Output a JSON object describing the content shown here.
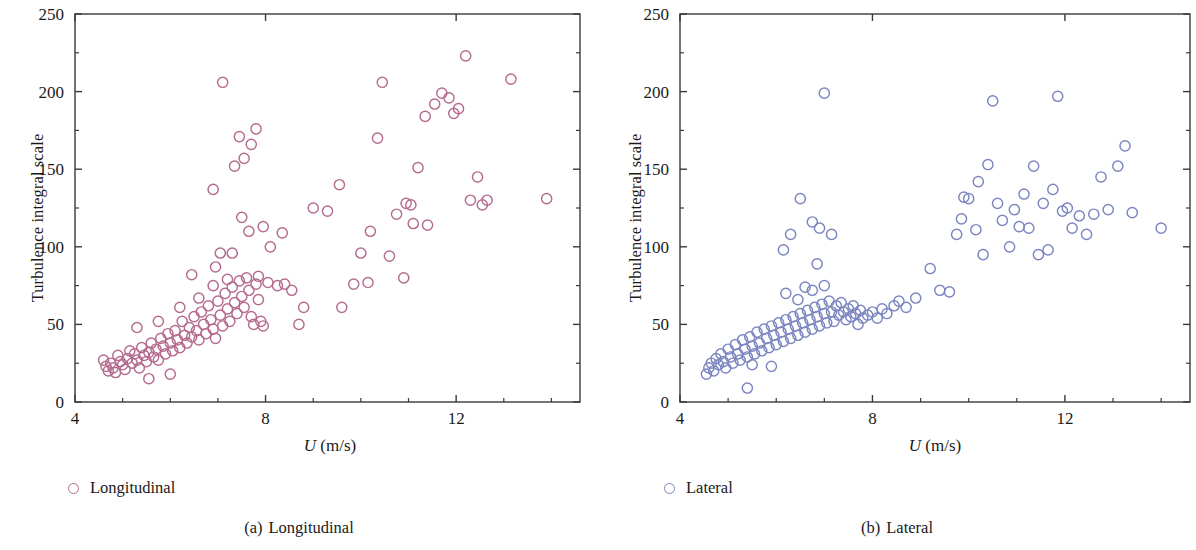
{
  "figure": {
    "panel_count": 2,
    "background": "#ffffff",
    "axis_color": "#3a3a3a"
  },
  "panels": [
    {
      "key": "a",
      "caption_tag": "(a)",
      "caption_text": "Longitudinal",
      "legend_label": "Longitudinal",
      "marker_color": "#b56b8e",
      "xlabel_var": "U",
      "xlabel_units": " (m/s)",
      "ylabel": "Turbulence integral scale"
    },
    {
      "key": "b",
      "caption_tag": "(b)",
      "caption_text": "Lateral",
      "legend_label": "Lateral",
      "marker_color": "#7b85c0",
      "xlabel_var": "U",
      "xlabel_units": " (m/s)",
      "ylabel": "Turbulence integral scale"
    }
  ],
  "chart_data": [
    {
      "type": "scatter",
      "panel": "a",
      "title": "(a) Longitudinal",
      "xlabel": "U (m/s)",
      "ylabel": "Turbulence integral scale",
      "legend": [
        "Longitudinal"
      ],
      "legend_position": "below-left",
      "grid": false,
      "marker": "open-circle",
      "color": "#b56b8e",
      "xlim": [
        4,
        14.6
      ],
      "ylim": [
        0,
        250
      ],
      "xticks": [
        4,
        8,
        12
      ],
      "xticks_minor": [
        5,
        6,
        7,
        9,
        10,
        11,
        13,
        14
      ],
      "yticks": [
        0,
        50,
        100,
        150,
        200,
        250
      ],
      "yticks_minor": [
        25,
        75,
        125,
        175,
        225
      ],
      "points": [
        [
          4.6,
          27
        ],
        [
          4.65,
          23
        ],
        [
          4.7,
          20
        ],
        [
          4.75,
          25
        ],
        [
          4.8,
          22
        ],
        [
          4.85,
          19
        ],
        [
          4.9,
          30
        ],
        [
          4.95,
          26
        ],
        [
          5.0,
          24
        ],
        [
          5.05,
          21
        ],
        [
          5.1,
          28
        ],
        [
          5.15,
          33
        ],
        [
          5.2,
          25
        ],
        [
          5.25,
          31
        ],
        [
          5.3,
          27
        ],
        [
          5.35,
          22
        ],
        [
          5.4,
          35
        ],
        [
          5.45,
          30
        ],
        [
          5.5,
          26
        ],
        [
          5.55,
          32
        ],
        [
          5.6,
          38
        ],
        [
          5.65,
          29
        ],
        [
          5.7,
          34
        ],
        [
          5.75,
          27
        ],
        [
          5.8,
          41
        ],
        [
          5.85,
          36
        ],
        [
          5.9,
          31
        ],
        [
          5.95,
          44
        ],
        [
          6.0,
          38
        ],
        [
          6.05,
          33
        ],
        [
          6.1,
          46
        ],
        [
          6.15,
          40
        ],
        [
          6.2,
          35
        ],
        [
          6.25,
          52
        ],
        [
          6.3,
          43
        ],
        [
          6.35,
          38
        ],
        [
          6.4,
          48
        ],
        [
          6.45,
          42
        ],
        [
          6.5,
          55
        ],
        [
          6.55,
          46
        ],
        [
          6.6,
          40
        ],
        [
          6.65,
          58
        ],
        [
          6.7,
          50
        ],
        [
          6.75,
          44
        ],
        [
          6.8,
          62
        ],
        [
          6.85,
          53
        ],
        [
          6.9,
          47
        ],
        [
          6.95,
          41
        ],
        [
          7.0,
          65
        ],
        [
          7.05,
          56
        ],
        [
          7.1,
          49
        ],
        [
          7.15,
          70
        ],
        [
          7.2,
          60
        ],
        [
          7.25,
          52
        ],
        [
          7.3,
          74
        ],
        [
          7.35,
          64
        ],
        [
          7.4,
          57
        ],
        [
          7.45,
          78
        ],
        [
          7.5,
          68
        ],
        [
          7.55,
          61
        ],
        [
          7.6,
          80
        ],
        [
          7.65,
          72
        ],
        [
          7.7,
          55
        ],
        [
          7.75,
          50
        ],
        [
          7.8,
          76
        ],
        [
          7.85,
          66
        ],
        [
          7.9,
          52
        ],
        [
          7.95,
          49
        ],
        [
          5.55,
          15
        ],
        [
          6.0,
          18
        ],
        [
          5.3,
          48
        ],
        [
          5.75,
          52
        ],
        [
          6.2,
          61
        ],
        [
          6.6,
          67
        ],
        [
          6.9,
          75
        ],
        [
          7.05,
          96
        ],
        [
          7.3,
          96
        ],
        [
          6.9,
          137
        ],
        [
          7.1,
          206
        ],
        [
          7.45,
          171
        ],
        [
          7.35,
          152
        ],
        [
          7.55,
          157
        ],
        [
          7.7,
          166
        ],
        [
          7.8,
          176
        ],
        [
          7.5,
          119
        ],
        [
          7.65,
          110
        ],
        [
          7.95,
          113
        ],
        [
          6.45,
          82
        ],
        [
          6.95,
          87
        ],
        [
          7.2,
          79
        ],
        [
          7.85,
          81
        ],
        [
          8.05,
          77
        ],
        [
          8.25,
          75
        ],
        [
          8.4,
          76
        ],
        [
          8.55,
          72
        ],
        [
          8.8,
          61
        ],
        [
          9.0,
          125
        ],
        [
          9.3,
          123
        ],
        [
          9.55,
          140
        ],
        [
          9.85,
          76
        ],
        [
          10.0,
          96
        ],
        [
          10.2,
          110
        ],
        [
          10.35,
          170
        ],
        [
          10.45,
          206
        ],
        [
          10.6,
          94
        ],
        [
          10.75,
          121
        ],
        [
          10.9,
          80
        ],
        [
          10.95,
          128
        ],
        [
          11.05,
          127
        ],
        [
          11.1,
          115
        ],
        [
          11.2,
          151
        ],
        [
          11.35,
          184
        ],
        [
          11.55,
          192
        ],
        [
          11.7,
          199
        ],
        [
          11.85,
          196
        ],
        [
          11.95,
          186
        ],
        [
          12.05,
          189
        ],
        [
          12.2,
          223
        ],
        [
          12.3,
          130
        ],
        [
          12.45,
          145
        ],
        [
          12.55,
          127
        ],
        [
          12.65,
          130
        ],
        [
          13.15,
          208
        ],
        [
          13.9,
          131
        ],
        [
          8.7,
          50
        ],
        [
          9.6,
          61
        ],
        [
          10.15,
          77
        ],
        [
          11.4,
          114
        ],
        [
          8.1,
          100
        ],
        [
          8.35,
          109
        ]
      ]
    },
    {
      "type": "scatter",
      "panel": "b",
      "title": "(b) Lateral",
      "xlabel": "U (m/s)",
      "ylabel": "Turbulence integral scale",
      "legend": [
        "Lateral"
      ],
      "legend_position": "below-left",
      "grid": false,
      "marker": "open-circle",
      "color": "#7b85c0",
      "xlim": [
        4,
        14.6
      ],
      "ylim": [
        0,
        250
      ],
      "xticks": [
        4,
        8,
        12
      ],
      "xticks_minor": [
        5,
        6,
        7,
        9,
        10,
        11,
        13,
        14
      ],
      "yticks": [
        0,
        50,
        100,
        150,
        200,
        250
      ],
      "yticks_minor": [
        25,
        75,
        125,
        175,
        225
      ],
      "points": [
        [
          4.55,
          18
        ],
        [
          4.6,
          22
        ],
        [
          4.65,
          25
        ],
        [
          4.7,
          20
        ],
        [
          4.75,
          28
        ],
        [
          4.8,
          24
        ],
        [
          4.85,
          31
        ],
        [
          4.9,
          26
        ],
        [
          4.95,
          22
        ],
        [
          5.0,
          34
        ],
        [
          5.05,
          29
        ],
        [
          5.1,
          25
        ],
        [
          5.15,
          37
        ],
        [
          5.2,
          31
        ],
        [
          5.25,
          27
        ],
        [
          5.3,
          40
        ],
        [
          5.35,
          34
        ],
        [
          5.4,
          29
        ],
        [
          5.45,
          42
        ],
        [
          5.5,
          36
        ],
        [
          5.55,
          31
        ],
        [
          5.6,
          45
        ],
        [
          5.65,
          38
        ],
        [
          5.7,
          33
        ],
        [
          5.75,
          47
        ],
        [
          5.8,
          41
        ],
        [
          5.85,
          35
        ],
        [
          5.9,
          49
        ],
        [
          5.95,
          43
        ],
        [
          6.0,
          37
        ],
        [
          6.05,
          51
        ],
        [
          6.1,
          45
        ],
        [
          6.15,
          39
        ],
        [
          6.2,
          53
        ],
        [
          6.25,
          47
        ],
        [
          6.3,
          41
        ],
        [
          6.35,
          55
        ],
        [
          6.4,
          49
        ],
        [
          6.45,
          43
        ],
        [
          6.5,
          57
        ],
        [
          6.55,
          51
        ],
        [
          6.6,
          45
        ],
        [
          6.65,
          59
        ],
        [
          6.7,
          53
        ],
        [
          6.75,
          47
        ],
        [
          6.8,
          61
        ],
        [
          6.85,
          55
        ],
        [
          6.9,
          49
        ],
        [
          6.95,
          63
        ],
        [
          7.0,
          57
        ],
        [
          7.05,
          51
        ],
        [
          7.1,
          65
        ],
        [
          7.15,
          58
        ],
        [
          7.2,
          52
        ],
        [
          7.25,
          62
        ],
        [
          7.3,
          56
        ],
        [
          7.35,
          64
        ],
        [
          7.4,
          58
        ],
        [
          7.45,
          53
        ],
        [
          7.5,
          60
        ],
        [
          7.55,
          55
        ],
        [
          7.6,
          62
        ],
        [
          7.65,
          57
        ],
        [
          7.7,
          50
        ],
        [
          7.75,
          59
        ],
        [
          7.8,
          54
        ],
        [
          7.9,
          56
        ],
        [
          8.0,
          58
        ],
        [
          8.1,
          54
        ],
        [
          8.2,
          60
        ],
        [
          8.3,
          57
        ],
        [
          8.45,
          62
        ],
        [
          8.55,
          65
        ],
        [
          8.7,
          61
        ],
        [
          8.9,
          67
        ],
        [
          5.4,
          9
        ],
        [
          5.5,
          24
        ],
        [
          5.9,
          23
        ],
        [
          6.2,
          70
        ],
        [
          6.45,
          66
        ],
        [
          6.6,
          74
        ],
        [
          6.75,
          72
        ],
        [
          6.85,
          89
        ],
        [
          7.0,
          75
        ],
        [
          6.3,
          108
        ],
        [
          6.5,
          131
        ],
        [
          6.75,
          116
        ],
        [
          6.9,
          112
        ],
        [
          7.0,
          199
        ],
        [
          7.15,
          108
        ],
        [
          6.15,
          98
        ],
        [
          9.2,
          86
        ],
        [
          9.4,
          72
        ],
        [
          9.6,
          71
        ],
        [
          9.75,
          108
        ],
        [
          9.9,
          132
        ],
        [
          10.0,
          131
        ],
        [
          10.15,
          111
        ],
        [
          10.3,
          95
        ],
        [
          10.4,
          153
        ],
        [
          10.5,
          194
        ],
        [
          10.6,
          128
        ],
        [
          10.7,
          117
        ],
        [
          10.85,
          100
        ],
        [
          10.95,
          124
        ],
        [
          11.05,
          113
        ],
        [
          11.15,
          134
        ],
        [
          11.25,
          112
        ],
        [
          11.35,
          152
        ],
        [
          11.45,
          95
        ],
        [
          11.55,
          128
        ],
        [
          11.65,
          98
        ],
        [
          11.75,
          137
        ],
        [
          11.85,
          197
        ],
        [
          11.95,
          123
        ],
        [
          12.05,
          125
        ],
        [
          12.15,
          112
        ],
        [
          12.3,
          120
        ],
        [
          12.45,
          108
        ],
        [
          12.6,
          121
        ],
        [
          12.75,
          145
        ],
        [
          12.9,
          124
        ],
        [
          13.1,
          152
        ],
        [
          13.25,
          165
        ],
        [
          13.4,
          122
        ],
        [
          14.0,
          112
        ],
        [
          10.2,
          142
        ],
        [
          9.85,
          118
        ]
      ]
    }
  ]
}
